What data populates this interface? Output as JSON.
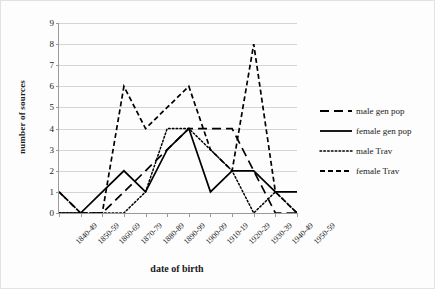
{
  "chart_data": {
    "type": "line",
    "title": "",
    "xlabel": "date of birth",
    "ylabel": "number of sources",
    "categories": [
      "1840-49",
      "1850-59",
      "1860-69",
      "1870-79",
      "1880-89",
      "1890-99",
      "1900-09",
      "1910-19",
      "1920-29",
      "1930-39",
      "1940-49",
      "1950-59"
    ],
    "yticks": [
      0,
      1,
      2,
      3,
      4,
      5,
      6,
      7,
      8,
      9
    ],
    "ylim": [
      0,
      9
    ],
    "grid": "horizontal",
    "legend_position": "right",
    "series": [
      {
        "name": "male gen pop",
        "style": "long-dash",
        "color": "#000000",
        "values": [
          1,
          0,
          0,
          1,
          2,
          3,
          4,
          4,
          4,
          2,
          0,
          0
        ]
      },
      {
        "name": "female gen pop",
        "style": "solid",
        "color": "#000000",
        "values": [
          0,
          0,
          1,
          2,
          1,
          3,
          4,
          1,
          2,
          2,
          1,
          1
        ]
      },
      {
        "name": "male Trav",
        "style": "dotted",
        "color": "#000000",
        "values": [
          0,
          0,
          0,
          0,
          1,
          4,
          4,
          3,
          2,
          0,
          1,
          0
        ]
      },
      {
        "name": "female Trav",
        "style": "short-dash",
        "color": "#000000",
        "values": [
          1,
          0,
          0,
          6,
          4,
          5,
          6,
          3,
          2,
          8,
          1,
          0
        ]
      }
    ]
  },
  "legend": {
    "items": [
      {
        "label": "male gen pop"
      },
      {
        "label": "female gen pop"
      },
      {
        "label": "male Trav"
      },
      {
        "label": "female Trav"
      }
    ]
  }
}
